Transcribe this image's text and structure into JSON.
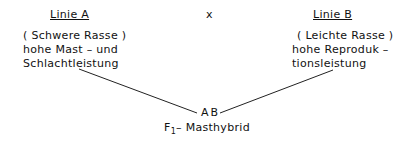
{
  "lineA": {
    "title": "Linie A",
    "line1": "( Schwere Rasse )",
    "line2": "hohe Mast – und",
    "line3": "Schlachtleistung"
  },
  "cross_symbol": "x",
  "lineB": {
    "title": "Linie B",
    "line1": "( Leichte Rasse )",
    "line2": "hohe Reproduk –",
    "line3": "tionsleistung"
  },
  "offspring": {
    "label": "AB",
    "generation": "F",
    "generation_sub": "1",
    "description": "– Masthybrid"
  }
}
